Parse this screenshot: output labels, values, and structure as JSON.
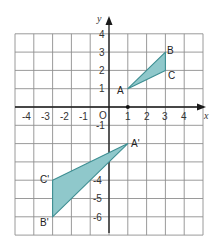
{
  "diagram": {
    "type": "coordinate-grid-reflection",
    "x_axis": {
      "label": "x",
      "range": [
        -5,
        5
      ],
      "ticks": [
        "-4",
        "-3",
        "-2",
        "-1",
        "1",
        "2",
        "3",
        "4"
      ]
    },
    "y_axis": {
      "label": "y",
      "range": [
        -7,
        4
      ],
      "ticks": [
        "4",
        "3",
        "2",
        "1",
        "-1",
        "-4",
        "-5",
        "-6"
      ]
    },
    "origin_label": "O",
    "colors": {
      "fill": "#8fc8cb",
      "stroke": "#3d8e92",
      "grid": "#8f8f8f"
    },
    "triangles": [
      {
        "name": "ABC",
        "points": [
          {
            "label": "A",
            "x": 1,
            "y": 1
          },
          {
            "label": "B",
            "x": 3,
            "y": 3
          },
          {
            "label": "C",
            "x": 3,
            "y": 2
          }
        ]
      },
      {
        "name": "A'B'C'",
        "points": [
          {
            "label": "A'",
            "x": 1,
            "y": -2
          },
          {
            "label": "B'",
            "x": -3,
            "y": -6
          },
          {
            "label": "C'",
            "x": -3,
            "y": -4
          }
        ]
      }
    ],
    "marked_point": {
      "x": 1,
      "y": 0
    }
  }
}
